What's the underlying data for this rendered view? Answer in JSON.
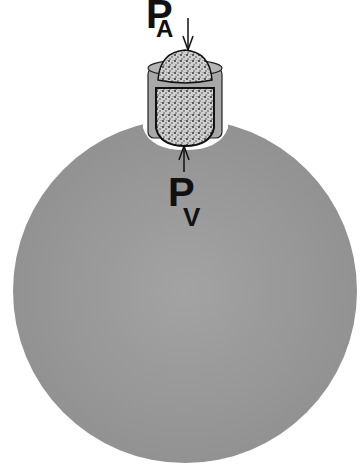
{
  "diagram": {
    "labels": {
      "top": {
        "main": "P",
        "sub": "A"
      },
      "bottom": {
        "main": "P",
        "sub": "V"
      }
    },
    "colors": {
      "sphere": "#9a9a9a",
      "cap_ring": "#a8a8a8",
      "stipple": "#c8c8c8",
      "outline": "#111111",
      "background": "#ffffff"
    }
  }
}
